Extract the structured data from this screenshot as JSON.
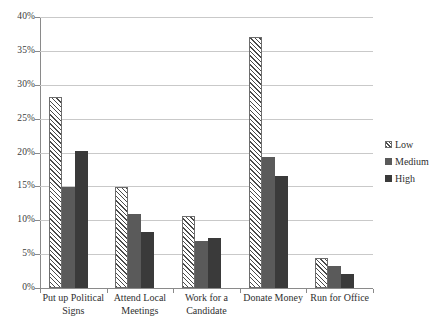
{
  "chart_data": {
    "type": "bar",
    "title": "",
    "xlabel": "",
    "ylabel": "",
    "ylim": [
      0,
      40
    ],
    "y_tick_labels": [
      "0%",
      "5%",
      "10%",
      "15%",
      "20%",
      "25%",
      "30%",
      "35%",
      "40%"
    ],
    "y_tick_values": [
      0,
      5,
      10,
      15,
      20,
      25,
      30,
      35,
      40
    ],
    "grid": true,
    "legend_position": "right",
    "categories": [
      "Put up Political Signs",
      "Attend Local Meetings",
      "Work for a Candidate",
      "Donate Money",
      "Run for Office"
    ],
    "category_label_lines": [
      [
        "Put up Political",
        "Signs"
      ],
      [
        "Attend Local",
        "Meetings"
      ],
      [
        "Work for a",
        "Candidate"
      ],
      [
        "Donate Money"
      ],
      [
        "Run for Office"
      ]
    ],
    "series": [
      {
        "name": "Low",
        "style": "hatched",
        "color": "#ffffff",
        "values": [
          28.2,
          14.9,
          10.6,
          37.1,
          4.4
        ]
      },
      {
        "name": "Medium",
        "style": "solid",
        "color": "#5a5a5a",
        "values": [
          14.9,
          10.9,
          7.0,
          19.4,
          3.3
        ]
      },
      {
        "name": "High",
        "style": "solid",
        "color": "#3a3a3a",
        "values": [
          20.2,
          8.2,
          7.4,
          16.5,
          2.1
        ]
      }
    ]
  },
  "legend": {
    "items": [
      {
        "label": "Low"
      },
      {
        "label": "Medium"
      },
      {
        "label": "High"
      }
    ]
  },
  "axes": {
    "grid_color": "#c9c9c9",
    "axis_color": "#8a8a8a"
  }
}
